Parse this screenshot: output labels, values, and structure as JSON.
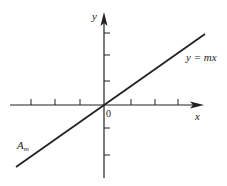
{
  "diagram": {
    "type": "linear-function-graph",
    "x_axis_label": "x",
    "y_axis_label": "y",
    "origin_label": "0",
    "line_label": "y = mx",
    "line_endpoint_label_base": "A",
    "line_endpoint_label_sub": "m",
    "x_ticks_each_side": 3,
    "y_ticks_above": 3,
    "y_ticks_below": 2,
    "colors": {
      "stroke": "#222222",
      "background": "#ffffff"
    }
  }
}
